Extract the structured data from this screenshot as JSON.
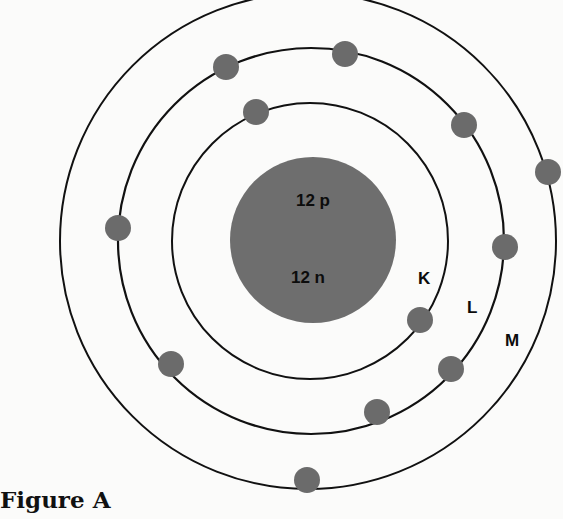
{
  "figure": {
    "caption": "Figure A",
    "nucleus": {
      "protons_label": "12 p",
      "neutrons_label": "12 n",
      "color": "#6e6e6e"
    },
    "shells": [
      {
        "label": "K",
        "electrons": 2
      },
      {
        "label": "L",
        "electrons": 8
      },
      {
        "label": "M",
        "electrons": 2
      }
    ],
    "electron_color": "#6b6b6b",
    "line_color": "#111111"
  }
}
